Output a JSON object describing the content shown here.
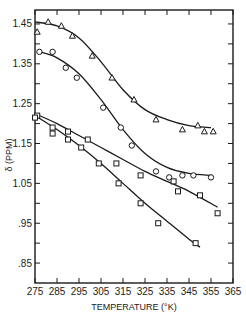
{
  "chart_data": {
    "type": "scatter",
    "title": "",
    "xlabel": "TEMPERATURE (°K)",
    "ylabel": "δ (PPM)",
    "xlim": [
      275,
      365
    ],
    "ylim": [
      0.8,
      1.485
    ],
    "xticks": [
      275,
      285,
      295,
      305,
      315,
      325,
      335,
      345,
      355,
      365
    ],
    "xtick_labels": [
      "275",
      "285",
      "295",
      "305",
      "315",
      "325",
      "335",
      "345",
      "355",
      "365"
    ],
    "yticks": [
      0.85,
      0.95,
      1.05,
      1.15,
      1.25,
      1.35,
      1.45
    ],
    "ytick_labels": [
      ".85",
      ".95",
      "1.05",
      "1.15",
      "1.25",
      "1.35",
      "1.45"
    ],
    "grid": false,
    "legend": "none",
    "series": [
      {
        "name": "triangles",
        "marker": "triangle",
        "points": [
          [
            276,
            1.43
          ],
          [
            281,
            1.455
          ],
          [
            287,
            1.445
          ],
          [
            292,
            1.42
          ],
          [
            301,
            1.37
          ],
          [
            310,
            1.315
          ],
          [
            320,
            1.26
          ],
          [
            330,
            1.21
          ],
          [
            342,
            1.185
          ],
          [
            349,
            1.195
          ],
          [
            352,
            1.18
          ],
          [
            356,
            1.18
          ]
        ],
        "fit": [
          [
            275,
            1.455
          ],
          [
            285,
            1.445
          ],
          [
            295,
            1.415
          ],
          [
            305,
            1.355
          ],
          [
            315,
            1.285
          ],
          [
            325,
            1.235
          ],
          [
            335,
            1.21
          ],
          [
            345,
            1.195
          ],
          [
            355,
            1.19
          ]
        ]
      },
      {
        "name": "circles",
        "marker": "circle",
        "points": [
          [
            277,
            1.38
          ],
          [
            283,
            1.38
          ],
          [
            289,
            1.34
          ],
          [
            294,
            1.315
          ],
          [
            306,
            1.24
          ],
          [
            314,
            1.19
          ],
          [
            319,
            1.145
          ],
          [
            330,
            1.08
          ],
          [
            336,
            1.065
          ],
          [
            342,
            1.07
          ],
          [
            347,
            1.07
          ],
          [
            355,
            1.065
          ]
        ],
        "fit": [
          [
            277,
            1.38
          ],
          [
            285,
            1.365
          ],
          [
            295,
            1.325
          ],
          [
            305,
            1.26
          ],
          [
            315,
            1.185
          ],
          [
            325,
            1.125
          ],
          [
            335,
            1.09
          ],
          [
            345,
            1.075
          ],
          [
            355,
            1.07
          ]
        ]
      },
      {
        "name": "squares-upper",
        "marker": "square",
        "points": [
          [
            276,
            1.22
          ],
          [
            283,
            1.19
          ],
          [
            290,
            1.18
          ],
          [
            299,
            1.16
          ],
          [
            312,
            1.1
          ],
          [
            323,
            1.07
          ],
          [
            338,
            1.055
          ],
          [
            340,
            1.03
          ],
          [
            350,
            1.02
          ],
          [
            358,
            0.975
          ]
        ],
        "fit": [
          [
            275,
            1.225
          ],
          [
            285,
            1.2
          ],
          [
            295,
            1.17
          ],
          [
            305,
            1.14
          ],
          [
            315,
            1.11
          ],
          [
            325,
            1.08
          ],
          [
            335,
            1.055
          ],
          [
            345,
            1.03
          ],
          [
            358,
            0.99
          ]
        ]
      },
      {
        "name": "squares-lower",
        "marker": "square",
        "points": [
          [
            275,
            1.215
          ],
          [
            283,
            1.175
          ],
          [
            290,
            1.16
          ],
          [
            296,
            1.14
          ],
          [
            304,
            1.1
          ],
          [
            313,
            1.05
          ],
          [
            323,
            1.0
          ],
          [
            331,
            0.95
          ],
          [
            348,
            0.9
          ]
        ],
        "fit": [
          [
            275,
            1.22
          ],
          [
            285,
            1.185
          ],
          [
            295,
            1.145
          ],
          [
            305,
            1.1
          ],
          [
            315,
            1.05
          ],
          [
            325,
            1.0
          ],
          [
            335,
            0.955
          ],
          [
            345,
            0.91
          ],
          [
            350,
            0.89
          ]
        ]
      }
    ],
    "colors": {
      "ink": "#1a1a1a",
      "background": "#ffffff"
    }
  }
}
